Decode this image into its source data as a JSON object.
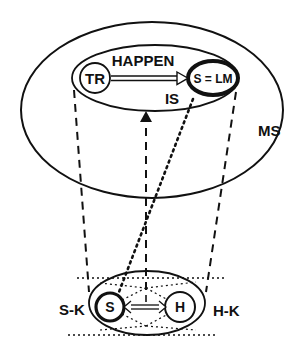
{
  "diagram": {
    "type": "conceptual-blend-schematic",
    "stroke_color": "#111111",
    "background": "#ffffff",
    "upper_space": {
      "label": "MS",
      "inner_frame": {
        "top_label": "HAPPEN",
        "bottom_label": "IS",
        "trajector": {
          "label": "TR"
        },
        "landmark": {
          "label": "S = LM"
        },
        "relation": "double-line arrow TR → S = LM"
      }
    },
    "lower_space": {
      "left_label": "S-K",
      "right_label": "H-K",
      "speaker": {
        "label": "S"
      },
      "hearer": {
        "label": "H"
      },
      "relation": "double-headed arrow S ↔ H"
    },
    "connectors": [
      {
        "from": "lower-space-left",
        "to": "inner-frame-left",
        "style": "dashed"
      },
      {
        "from": "lower-space-center",
        "to": "inner-frame-bottom",
        "style": "dashed-arrow-up"
      },
      {
        "from": "lower-space-right",
        "to": "landmark",
        "style": "dashed"
      },
      {
        "from": "speaker",
        "to": "landmark",
        "style": "dotted"
      }
    ]
  }
}
